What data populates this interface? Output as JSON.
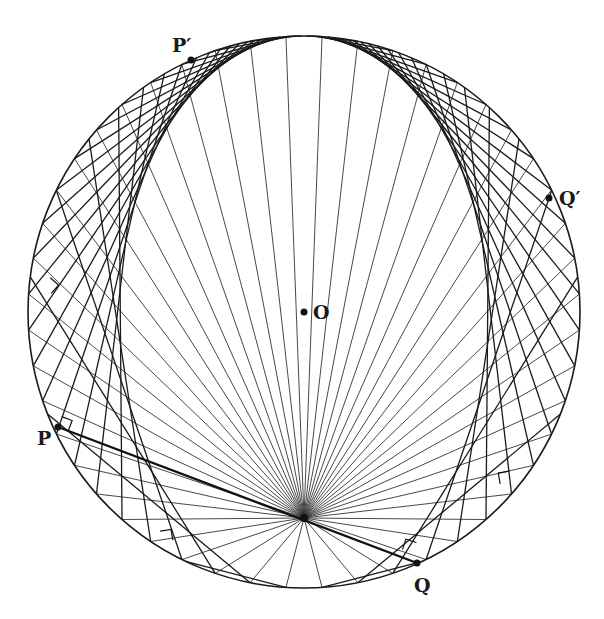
{
  "figure": {
    "circle": {
      "cx": 304,
      "cy": 312,
      "r": 276
    },
    "focus": {
      "x": 304,
      "y": 518
    },
    "ray_count": 48,
    "colors": {
      "stroke": "#1a1a1a",
      "ray": "#333333",
      "background": "#ffffff"
    },
    "labels": {
      "center": "O",
      "p": "P",
      "p_prime": "P′",
      "q": "Q",
      "q_prime": "Q′"
    },
    "points": {
      "center": {
        "x": 304,
        "y": 312
      },
      "p": {
        "x": 58,
        "y": 427
      },
      "p_prime": {
        "x": 191,
        "y": 60
      },
      "q": {
        "x": 417,
        "y": 563
      },
      "q_prime": {
        "x": 549,
        "y": 198
      }
    },
    "right_angle_marks": [
      {
        "at": "p"
      },
      {
        "x": 43,
        "y": 286
      },
      {
        "x": 162,
        "y": 542
      },
      {
        "x": 511,
        "y": 482
      },
      {
        "x": 413,
        "y": 553
      }
    ]
  }
}
